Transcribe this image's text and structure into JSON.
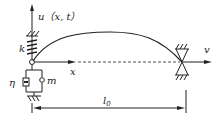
{
  "diagram": {
    "labels": {
      "displacement": "u（x, t）",
      "spring": "k",
      "damper": "η",
      "mass": "m",
      "x_axis": "x",
      "velocity": "v",
      "length": "l",
      "length_subscript": "0"
    },
    "colors": {
      "stroke": "#222222",
      "background": "#ffffff"
    }
  }
}
